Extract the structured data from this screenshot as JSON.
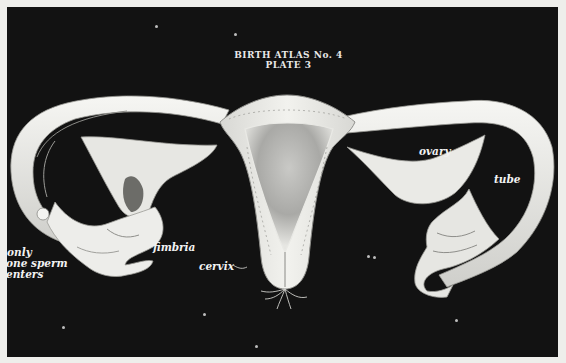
{
  "plate": {
    "title_line1": "BIRTH ATLAS No. 4",
    "title_line2": "PLATE 3",
    "background_color": "#121212",
    "model_color": "#ededea"
  },
  "labels": {
    "ovary": "ovary",
    "tube": "tube",
    "fimbria": "fimbria",
    "cervix": "cervix",
    "note_line1": "only",
    "note_line2": "one sperm",
    "note_line3": "enters"
  },
  "figure": {
    "structures": [
      "uterus",
      "cervix",
      "left fallopian tube",
      "left ovary",
      "left fimbria",
      "right fallopian tube",
      "right ovary",
      "right fimbria"
    ]
  }
}
